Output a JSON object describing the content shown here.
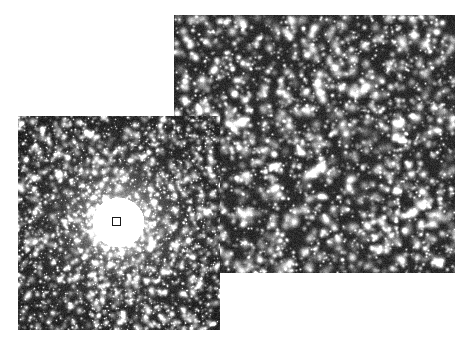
{
  "figure": {
    "background_color": "#ffffff",
    "width": 471,
    "height": 344,
    "panel_count": 2
  },
  "panels": [
    {
      "id": "panel-zoom",
      "name": "resolved-star-field-panel",
      "role": "wide-field resolved starfield (zoomed detail)",
      "x": 174,
      "y": 15,
      "width": 281,
      "height": 258,
      "background_color": "#2b2b2b",
      "star_color": "#f2f2f2",
      "z_order": 1,
      "star_count": 2600,
      "seed": 20143,
      "field_type": "uniform-dense",
      "star_scale": 1.0,
      "has_core_glow": false
    },
    {
      "id": "panel-cluster",
      "name": "globular-cluster-panel",
      "role": "globular cluster with saturated bright core",
      "x": 18,
      "y": 116,
      "width": 202,
      "height": 214,
      "background_color": "#1e1e1e",
      "star_color": "#ededed",
      "z_order": 2,
      "star_count": 5200,
      "seed": 8821,
      "field_type": "centrally-concentrated",
      "star_scale": 0.72,
      "has_core_glow": true,
      "core_center_x": 100,
      "core_center_y": 106,
      "core_radius": 86,
      "core_peak_brightness": 255
    }
  ],
  "marker": {
    "name": "core-region-marker",
    "shape": "square",
    "x": 112,
    "y": 217,
    "size": 9,
    "stroke_color": "#1a1a1a",
    "stroke_width": 1,
    "fill": "none",
    "meaning": "region of cluster core enlarged in the adjacent panel"
  },
  "accessibility": {
    "figure_alt": "Two overlapping grayscale astronomical images: a globular cluster with a bright unresolved core marked by a small square, and a larger panel showing the same field resolved into individual stars.",
    "panel_zoom_alt": "Dense field of individually resolved white stars on a dark background.",
    "panel_cluster_alt": "Globular star cluster with a bright saturated central glow fading into a dense halo of faint stars."
  }
}
